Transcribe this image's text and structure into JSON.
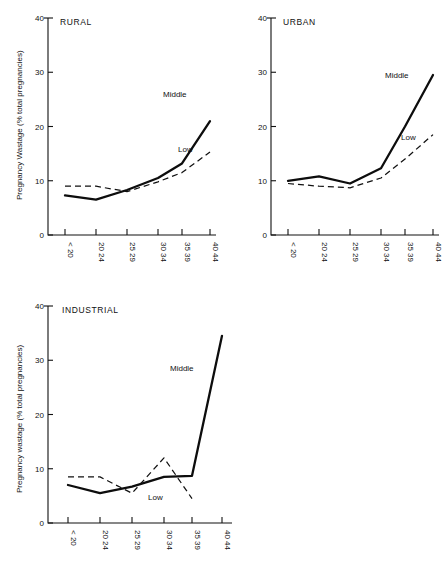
{
  "figure": {
    "panels": [
      "RURAL",
      "URBAN",
      "INDUSTRIAL"
    ]
  },
  "chart_data": [
    {
      "type": "line",
      "title": "RURAL",
      "xlabel": "",
      "ylabel": "Pregnancy Wastage (% total pregnancies)",
      "categories": [
        "< 20",
        "20 24",
        "25 29",
        "30 34",
        "35 39",
        "40 44"
      ],
      "ylim": [
        0,
        40
      ],
      "yticks": [
        0,
        10,
        20,
        30,
        40
      ],
      "ytick_labels": [
        "0",
        "10",
        "20",
        "30",
        "40"
      ],
      "grid": false,
      "legend": "inline-annotations",
      "series": [
        {
          "name": "Middle",
          "style": "solid",
          "values": [
            7.3,
            6.5,
            8.3,
            10.5,
            13.2,
            21.0
          ]
        },
        {
          "name": "Low",
          "style": "dashed",
          "values": [
            9.0,
            9.0,
            8.0,
            9.8,
            11.5,
            15.3
          ]
        }
      ],
      "annotations": [
        {
          "text": "Middle",
          "near_category": "35 39"
        },
        {
          "text": "Low",
          "near_category": "35 39"
        }
      ]
    },
    {
      "type": "line",
      "title": "URBAN",
      "xlabel": "",
      "ylabel": "",
      "categories": [
        "< 20",
        "20 24",
        "25 29",
        "30 34",
        "35 39",
        "40 44"
      ],
      "ylim": [
        0,
        40
      ],
      "yticks": [
        0,
        10,
        20,
        30,
        40
      ],
      "ytick_labels": [
        "0",
        "10",
        "20",
        "30",
        "40"
      ],
      "grid": false,
      "legend": "inline-annotations",
      "series": [
        {
          "name": "Middle",
          "style": "solid",
          "values": [
            10.0,
            10.8,
            9.5,
            12.3,
            20.0,
            29.5
          ]
        },
        {
          "name": "Low",
          "style": "dashed",
          "values": [
            9.5,
            9.0,
            8.7,
            10.5,
            14.0,
            18.5
          ]
        }
      ],
      "annotations": [
        {
          "text": "Middle",
          "near_category": "35 39"
        },
        {
          "text": "Low",
          "near_category": "35 39"
        }
      ]
    },
    {
      "type": "line",
      "title": "INDUSTRIAL",
      "xlabel": "",
      "ylabel": "Pregnancy wastage (% total pregnancies)",
      "categories": [
        "< 20",
        "20 24",
        "25 29",
        "30 34",
        "35 39",
        "40 44"
      ],
      "ylim": [
        0,
        40
      ],
      "yticks": [
        0,
        10,
        20,
        30,
        40
      ],
      "ytick_labels": [
        "0",
        "10",
        "20",
        "30",
        "40"
      ],
      "grid": false,
      "legend": "inline-annotations",
      "series": [
        {
          "name": "Middle",
          "style": "solid",
          "values": [
            7.0,
            5.5,
            6.7,
            8.5,
            8.7,
            34.5
          ]
        },
        {
          "name": "Low",
          "style": "dashed",
          "values": [
            8.5,
            8.5,
            5.5,
            12.0,
            4.5,
            null
          ]
        }
      ],
      "annotations": [
        {
          "text": "Middle",
          "near_category": "30 34"
        },
        {
          "text": "Low",
          "near_category": "35 39"
        }
      ]
    }
  ],
  "labels": {
    "rural": {
      "title": "RURAL",
      "ylabel": "Pregnancy Wastage (% total pregnancies)",
      "middle": "Middle",
      "low": "Low",
      "y0": "0",
      "y10": "10",
      "y20": "20",
      "y30": "30",
      "y40": "40",
      "x0": "< 20",
      "x1": "20 24",
      "x2": "25 29",
      "x3": "30 34",
      "x4": "35 39",
      "x5": "40 44"
    },
    "urban": {
      "title": "URBAN",
      "middle": "Middle",
      "low": "Low",
      "y0": "0",
      "y10": "10",
      "y20": "20",
      "y30": "30",
      "y40": "40",
      "x0": "< 20",
      "x1": "20 24",
      "x2": "25 29",
      "x3": "30 34",
      "x4": "35 39",
      "x5": "40 44"
    },
    "industrial": {
      "title": "INDUSTRIAL",
      "ylabel": "Pregnancy wastage (% total pregnancies)",
      "middle": "Middle",
      "low": "Low",
      "y0": "0",
      "y10": "10",
      "y20": "20",
      "y30": "30",
      "y40": "40",
      "x0": "< 20",
      "x1": "20 24",
      "x2": "25 29",
      "x3": "30 34",
      "x4": "35 39",
      "x5": "40 44"
    }
  }
}
